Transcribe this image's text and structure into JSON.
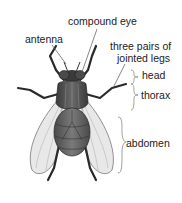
{
  "diagram": {
    "labels": {
      "compound_eye": "compound eye",
      "antenna": "antenna",
      "legs_line1": "three pairs of",
      "legs_line2": "jointed legs",
      "head": "head",
      "thorax": "thorax",
      "abdomen": "abdomen"
    },
    "colors": {
      "label_text": "#222222",
      "leader_line": "#555555",
      "body_dark": "#3a3a3a",
      "body_mid": "#6b6b6b",
      "wing_fill": "#e6e6e6",
      "background": "#ffffff"
    }
  }
}
